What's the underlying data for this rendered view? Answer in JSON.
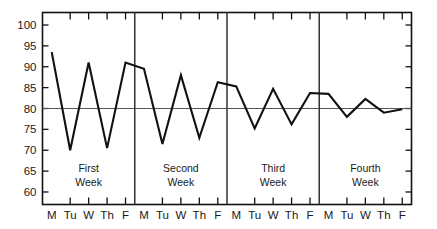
{
  "chart_data": {
    "type": "line",
    "title": "",
    "xlabel": "",
    "ylabel": "",
    "ylim": [
      57,
      103
    ],
    "yticks": [
      60,
      65,
      70,
      75,
      80,
      85,
      90,
      95,
      100
    ],
    "ytick_labels": [
      "60",
      "65",
      "70",
      "75",
      "80",
      "85",
      "90",
      "95",
      "100"
    ],
    "grid": false,
    "legend": "none",
    "reference_line": 80,
    "x": [
      "M",
      "Tu",
      "W",
      "Th",
      "F",
      "M",
      "Tu",
      "W",
      "Th",
      "F",
      "M",
      "Tu",
      "W",
      "Th",
      "F",
      "M",
      "Tu",
      "W",
      "Th",
      "F"
    ],
    "values": [
      93.5,
      70.0,
      91.0,
      70.5,
      91.0,
      89.5,
      71.5,
      88.0,
      73.0,
      86.3,
      85.3,
      75.2,
      84.7,
      76.2,
      83.7,
      83.5,
      78.0,
      82.3,
      79.0,
      79.8
    ],
    "groups": [
      {
        "label_line1": "First",
        "label_line2": "Week"
      },
      {
        "label_line1": "Second",
        "label_line2": "Week"
      },
      {
        "label_line1": "Third",
        "label_line2": "Week"
      },
      {
        "label_line1": "Fourth",
        "label_line2": "Week"
      }
    ],
    "colors": {
      "line": "#111111",
      "axis": "#111111",
      "reference_line": "#555555",
      "divider": "#333333",
      "background": "#ffffff",
      "text": "#1a1a1a"
    }
  }
}
